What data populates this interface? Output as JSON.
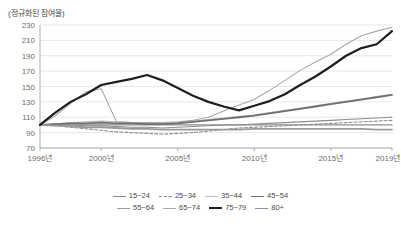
{
  "chart_data": {
    "type": "line",
    "title": "(정규화된 참여율)",
    "xlabel": "",
    "ylabel": "",
    "ylim": [
      70,
      230
    ],
    "ytick_values": [
      230,
      210,
      190,
      170,
      150,
      130,
      110,
      90,
      70
    ],
    "xlim": [
      1996,
      2019
    ],
    "xtick_values": [
      1996,
      2000,
      2005,
      2010,
      2015
    ],
    "xtick_labels": [
      "1996년",
      "2000년",
      "2005년",
      "2010년",
      "2015년"
    ],
    "x_end_label": "2019년",
    "grid": true,
    "legend_position": "bottom",
    "x": [
      1996,
      1997,
      1998,
      1999,
      2000,
      2001,
      2002,
      2003,
      2004,
      2005,
      2006,
      2007,
      2008,
      2009,
      2010,
      2011,
      2012,
      2013,
      2014,
      2015,
      2016,
      2017,
      2018,
      2019
    ],
    "series": [
      {
        "name": "15~24",
        "color": "#8c8c8c",
        "width": 1.1,
        "dash": "none",
        "values": [
          100,
          101,
          100,
          99,
          99,
          98,
          97,
          97,
          96,
          97,
          98,
          99,
          100,
          100,
          101,
          102,
          103,
          104,
          105,
          106,
          107,
          108,
          109,
          110
        ]
      },
      {
        "name": "25~34",
        "color": "#8c8c8c",
        "width": 1.1,
        "dash": "dashed",
        "values": [
          100,
          99,
          97,
          95,
          93,
          91,
          90,
          89,
          88,
          89,
          90,
          92,
          94,
          96,
          97,
          98,
          99,
          100,
          101,
          102,
          103,
          104,
          105,
          106
        ]
      },
      {
        "name": "35~44",
        "color": "#bdbdbd",
        "width": 1.1,
        "dash": "none",
        "values": [
          100,
          101,
          103,
          104,
          105,
          104,
          103,
          102,
          102,
          103,
          105,
          107,
          109,
          111,
          113,
          116,
          119,
          122,
          125,
          128,
          131,
          134,
          137,
          140
        ]
      },
      {
        "name": "45~54",
        "color": "#707070",
        "width": 1.8,
        "dash": "none",
        "values": [
          100,
          101,
          102,
          102,
          103,
          102,
          102,
          101,
          101,
          102,
          104,
          106,
          108,
          110,
          112,
          115,
          118,
          121,
          124,
          127,
          130,
          133,
          136,
          139
        ]
      },
      {
        "name": "55~64",
        "color": "#9a9a9a",
        "width": 1.8,
        "dash": "none",
        "values": [
          100,
          99,
          98,
          97,
          97,
          96,
          95,
          95,
          94,
          94,
          94,
          94,
          94,
          94,
          95,
          95,
          95,
          95,
          95,
          95,
          95,
          95,
          94,
          94
        ]
      },
      {
        "name": "65~74",
        "color": "#a8a8a8",
        "width": 1.1,
        "dash": "none",
        "values": [
          100,
          112,
          128,
          143,
          147,
          104,
          103,
          103,
          103,
          104,
          106,
          110,
          118,
          126,
          133,
          145,
          158,
          171,
          182,
          192,
          205,
          216,
          222,
          227
        ]
      },
      {
        "name": "75~79",
        "color": "#1f1f1f",
        "width": 2.2,
        "dash": "none",
        "values": [
          100,
          116,
          130,
          140,
          152,
          156,
          160,
          165,
          158,
          148,
          138,
          130,
          124,
          119,
          125,
          131,
          140,
          152,
          163,
          176,
          190,
          200,
          205,
          222
        ]
      },
      {
        "name": "80+",
        "color": "#8f8f8f",
        "width": 1.3,
        "dash": "none",
        "values": [
          100,
          100,
          100,
          100,
          100,
          100,
          100,
          100,
          100,
          100,
          100,
          100,
          100,
          100,
          100,
          100,
          100,
          100,
          100,
          100,
          100,
          100,
          100,
          100
        ]
      }
    ]
  }
}
